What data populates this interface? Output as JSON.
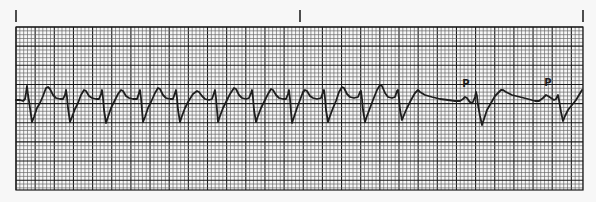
{
  "figure": {
    "paper_color": "#f7f7f7",
    "grid_color_minor": "#6a6a6a",
    "grid_color_major": "#1a1a1a",
    "trace_color": "#1e1e1e",
    "grid": {
      "x0": 16,
      "y0": 27,
      "x1": 583,
      "y1": 190,
      "minor_px": 3.83,
      "major_every": 5
    },
    "time_markers": [
      {
        "x": 16,
        "y0": 10,
        "y1": 22
      },
      {
        "x": 300,
        "y0": 10,
        "y1": 22
      },
      {
        "x": 583,
        "y0": 10,
        "y1": 22
      }
    ],
    "labels": [
      {
        "text": "P",
        "x": 466,
        "y": 87
      },
      {
        "text": "P",
        "x": 548,
        "y": 86
      }
    ],
    "trace_points": [
      [
        16,
        100
      ],
      [
        20,
        100
      ],
      [
        23,
        101
      ],
      [
        25,
        99
      ],
      [
        26,
        93
      ],
      [
        27,
        86
      ],
      [
        28,
        95
      ],
      [
        29,
        101
      ],
      [
        30,
        108
      ],
      [
        32,
        122
      ],
      [
        34,
        117
      ],
      [
        37,
        108
      ],
      [
        40,
        103
      ],
      [
        43,
        96
      ],
      [
        46,
        88
      ],
      [
        48,
        87
      ],
      [
        50,
        89
      ],
      [
        53,
        95
      ],
      [
        56,
        98
      ],
      [
        60,
        99
      ],
      [
        63,
        99
      ],
      [
        65,
        95
      ],
      [
        66,
        90
      ],
      [
        67,
        97
      ],
      [
        68,
        108
      ],
      [
        70,
        122
      ],
      [
        72,
        117
      ],
      [
        75,
        109
      ],
      [
        78,
        103
      ],
      [
        81,
        95
      ],
      [
        84,
        90
      ],
      [
        86,
        91
      ],
      [
        89,
        96
      ],
      [
        92,
        98
      ],
      [
        96,
        99
      ],
      [
        99,
        99
      ],
      [
        101,
        94
      ],
      [
        102,
        90
      ],
      [
        103,
        98
      ],
      [
        104,
        110
      ],
      [
        106,
        123
      ],
      [
        108,
        117
      ],
      [
        111,
        108
      ],
      [
        114,
        102
      ],
      [
        118,
        94
      ],
      [
        121,
        90
      ],
      [
        123,
        91
      ],
      [
        126,
        96
      ],
      [
        129,
        98
      ],
      [
        133,
        99
      ],
      [
        137,
        99
      ],
      [
        139,
        93
      ],
      [
        140,
        90
      ],
      [
        141,
        98
      ],
      [
        142,
        110
      ],
      [
        143,
        122
      ],
      [
        145,
        117
      ],
      [
        148,
        108
      ],
      [
        151,
        102
      ],
      [
        155,
        93
      ],
      [
        158,
        88
      ],
      [
        160,
        89
      ],
      [
        163,
        95
      ],
      [
        166,
        98
      ],
      [
        170,
        99
      ],
      [
        173,
        99
      ],
      [
        175,
        93
      ],
      [
        176,
        90
      ],
      [
        177,
        98
      ],
      [
        178,
        110
      ],
      [
        180,
        122
      ],
      [
        182,
        116
      ],
      [
        185,
        108
      ],
      [
        188,
        102
      ],
      [
        193,
        94
      ],
      [
        197,
        91
      ],
      [
        199,
        92
      ],
      [
        202,
        96
      ],
      [
        205,
        99
      ],
      [
        209,
        100
      ],
      [
        212,
        99
      ],
      [
        214,
        93
      ],
      [
        215,
        90
      ],
      [
        216,
        98
      ],
      [
        217,
        110
      ],
      [
        218,
        122
      ],
      [
        220,
        116
      ],
      [
        223,
        108
      ],
      [
        226,
        102
      ],
      [
        230,
        94
      ],
      [
        234,
        88
      ],
      [
        236,
        89
      ],
      [
        239,
        95
      ],
      [
        242,
        98
      ],
      [
        246,
        99
      ],
      [
        249,
        98
      ],
      [
        251,
        93
      ],
      [
        252,
        90
      ],
      [
        253,
        98
      ],
      [
        254,
        110
      ],
      [
        256,
        122
      ],
      [
        258,
        116
      ],
      [
        261,
        108
      ],
      [
        264,
        102
      ],
      [
        268,
        94
      ],
      [
        271,
        89
      ],
      [
        273,
        90
      ],
      [
        276,
        95
      ],
      [
        279,
        98
      ],
      [
        283,
        99
      ],
      [
        286,
        99
      ],
      [
        288,
        94
      ],
      [
        289,
        90
      ],
      [
        290,
        99
      ],
      [
        291,
        112
      ],
      [
        292,
        123
      ],
      [
        294,
        117
      ],
      [
        297,
        108
      ],
      [
        300,
        100
      ],
      [
        303,
        92
      ],
      [
        305,
        90
      ],
      [
        307,
        91
      ],
      [
        310,
        96
      ],
      [
        313,
        98
      ],
      [
        317,
        99
      ],
      [
        321,
        98
      ],
      [
        323,
        92
      ],
      [
        324,
        90
      ],
      [
        325,
        98
      ],
      [
        326,
        110
      ],
      [
        328,
        122
      ],
      [
        330,
        116
      ],
      [
        333,
        108
      ],
      [
        336,
        101
      ],
      [
        339,
        92
      ],
      [
        342,
        87
      ],
      [
        344,
        88
      ],
      [
        347,
        94
      ],
      [
        350,
        97
      ],
      [
        354,
        98
      ],
      [
        358,
        97
      ],
      [
        360,
        92
      ],
      [
        361,
        91
      ],
      [
        362,
        99
      ],
      [
        363,
        110
      ],
      [
        365,
        122
      ],
      [
        367,
        116
      ],
      [
        370,
        108
      ],
      [
        373,
        100
      ],
      [
        377,
        90
      ],
      [
        380,
        85
      ],
      [
        382,
        86
      ],
      [
        385,
        93
      ],
      [
        388,
        97
      ],
      [
        392,
        98
      ],
      [
        395,
        97
      ],
      [
        397,
        91
      ],
      [
        398,
        90
      ],
      [
        399,
        98
      ],
      [
        400,
        110
      ],
      [
        402,
        120
      ],
      [
        404,
        115
      ],
      [
        407,
        108
      ],
      [
        411,
        100
      ],
      [
        415,
        93
      ],
      [
        418,
        90
      ],
      [
        420,
        92
      ],
      [
        425,
        95
      ],
      [
        432,
        97
      ],
      [
        440,
        99
      ],
      [
        448,
        100
      ],
      [
        455,
        101
      ],
      [
        460,
        101
      ],
      [
        463,
        99
      ],
      [
        465,
        97
      ],
      [
        467,
        98
      ],
      [
        469,
        101
      ],
      [
        471,
        103
      ],
      [
        473,
        102
      ],
      [
        475,
        97
      ],
      [
        476,
        92
      ],
      [
        477,
        96
      ],
      [
        478,
        105
      ],
      [
        480,
        116
      ],
      [
        482,
        125
      ],
      [
        484,
        119
      ],
      [
        487,
        110
      ],
      [
        491,
        103
      ],
      [
        495,
        96
      ],
      [
        498,
        93
      ],
      [
        501,
        90
      ],
      [
        503,
        90
      ],
      [
        506,
        92
      ],
      [
        512,
        95
      ],
      [
        520,
        97
      ],
      [
        528,
        99
      ],
      [
        535,
        101
      ],
      [
        539,
        101
      ],
      [
        543,
        98
      ],
      [
        546,
        95
      ],
      [
        548,
        96
      ],
      [
        551,
        98
      ],
      [
        554,
        100
      ],
      [
        556,
        99
      ],
      [
        558,
        95
      ],
      [
        559,
        100
      ],
      [
        561,
        112
      ],
      [
        563,
        121
      ],
      [
        565,
        116
      ],
      [
        568,
        110
      ],
      [
        572,
        105
      ],
      [
        576,
        100
      ],
      [
        579,
        95
      ],
      [
        582,
        90
      ]
    ]
  }
}
